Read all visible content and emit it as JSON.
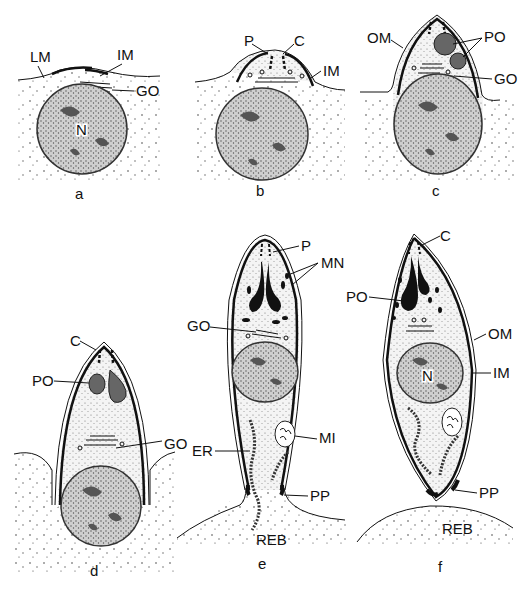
{
  "figure": {
    "panels": [
      {
        "id": "a",
        "label": "a",
        "annotations": [
          "LM",
          "IM",
          "GO",
          "N"
        ]
      },
      {
        "id": "b",
        "label": "b",
        "annotations": [
          "P",
          "C",
          "IM"
        ]
      },
      {
        "id": "c",
        "label": "c",
        "annotations": [
          "OM",
          "PO",
          "GO"
        ]
      },
      {
        "id": "d",
        "label": "d",
        "annotations": [
          "C",
          "PO",
          "GO"
        ]
      },
      {
        "id": "e",
        "label": "e",
        "annotations": [
          "P",
          "MN",
          "GO",
          "MI",
          "ER",
          "PP",
          "REB"
        ]
      },
      {
        "id": "f",
        "label": "f",
        "annotations": [
          "C",
          "PO",
          "OM",
          "IM",
          "N",
          "PP",
          "REB"
        ]
      }
    ]
  }
}
